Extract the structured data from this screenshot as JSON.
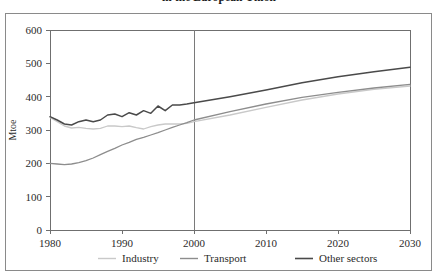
{
  "title": {
    "line1": "in the European Union"
  },
  "axes": {
    "y_title": "Mtoe",
    "y_ticks": [
      "0",
      "100",
      "200",
      "300",
      "400",
      "500",
      "600"
    ],
    "x_ticks": [
      "1980",
      "1990",
      "2000",
      "2010",
      "2020",
      "2030"
    ]
  },
  "legend": {
    "items": [
      {
        "label": "Industry",
        "color": "#c9c9c9"
      },
      {
        "label": "Transport",
        "color": "#8d8d8d"
      },
      {
        "label": "Other sectors",
        "color": "#4a4a4a"
      }
    ]
  },
  "chart_data": {
    "type": "line",
    "title": "in the European Union",
    "xlabel": "",
    "ylabel": "Mtoe",
    "xlim": [
      1980,
      2030
    ],
    "ylim": [
      0,
      600
    ],
    "grid": false,
    "legend_position": "bottom",
    "annotations": [
      {
        "type": "vline",
        "x": 2000,
        "note": "historical / projection divider"
      }
    ],
    "x": [
      1980,
      1981,
      1982,
      1983,
      1984,
      1985,
      1986,
      1987,
      1988,
      1989,
      1990,
      1991,
      1992,
      1993,
      1994,
      1995,
      1996,
      1997,
      1998,
      1999,
      2000,
      2005,
      2010,
      2015,
      2020,
      2025,
      2030
    ],
    "series": [
      {
        "name": "Industry",
        "color": "#c9c9c9",
        "values": [
          338,
          325,
          312,
          306,
          308,
          305,
          303,
          305,
          312,
          312,
          310,
          312,
          307,
          303,
          310,
          315,
          318,
          318,
          318,
          320,
          325,
          345,
          368,
          390,
          408,
          422,
          432
        ]
      },
      {
        "name": "Transport",
        "color": "#8d8d8d",
        "values": [
          200,
          198,
          196,
          198,
          202,
          208,
          216,
          226,
          236,
          245,
          255,
          263,
          272,
          278,
          285,
          292,
          300,
          308,
          315,
          322,
          330,
          355,
          378,
          398,
          413,
          426,
          437
        ]
      },
      {
        "name": "Other sectors",
        "color": "#4a4a4a",
        "values": [
          340,
          330,
          318,
          315,
          325,
          330,
          325,
          330,
          345,
          348,
          340,
          352,
          345,
          358,
          350,
          372,
          358,
          375,
          375,
          378,
          382,
          400,
          420,
          442,
          460,
          475,
          488
        ]
      }
    ]
  }
}
